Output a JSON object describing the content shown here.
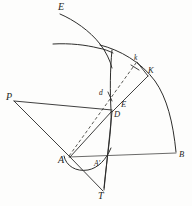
{
  "figure": {
    "background_color": "#fdfdfc",
    "ink_color": "#2a2a2a",
    "width": 192,
    "height": 206,
    "labels": {
      "E_top": "E",
      "k_lower": "k",
      "K_upper": "K",
      "d_lower": "d",
      "E_mid": "E",
      "D_mid": "D",
      "P_left": "P",
      "A_left": "A",
      "A_prime": "A'",
      "B_right": "B",
      "T_bottom": "T"
    },
    "points": [
      {
        "name": "E_top",
        "label": "E",
        "x": 62,
        "y": 8
      },
      {
        "name": "k_lower",
        "label": "k",
        "x": 137,
        "y": 60
      },
      {
        "name": "K_upper",
        "label": "K",
        "x": 150,
        "y": 72
      },
      {
        "name": "d_lower",
        "label": "d",
        "x": 104,
        "y": 95
      },
      {
        "name": "E_mid",
        "label": "E",
        "x": 123,
        "y": 106
      },
      {
        "name": "D_mid",
        "label": "D",
        "x": 116,
        "y": 114
      },
      {
        "name": "P_left",
        "label": "P",
        "x": 11,
        "y": 98
      },
      {
        "name": "A_left",
        "label": "A",
        "x": 68,
        "y": 158
      },
      {
        "name": "A_prime",
        "label": "A'",
        "x": 99,
        "y": 163
      },
      {
        "name": "B_right",
        "label": "B",
        "x": 178,
        "y": 155
      },
      {
        "name": "T_bottom",
        "label": "T",
        "x": 102,
        "y": 194
      }
    ],
    "strokes": [
      {
        "name": "upper-left-arc",
        "kind": "curve",
        "desc": "arc from E at top curving down-right past crossing"
      },
      {
        "name": "flat-left-arc",
        "kind": "curve",
        "desc": "shallow arc entering from left meeting the crossing"
      },
      {
        "name": "great-arc-to-B",
        "kind": "curve",
        "desc": "large arc from crossing sweeping right-down to B"
      },
      {
        "name": "vertical-curve-to-T",
        "kind": "curve",
        "desc": "near-vertical curve through D down to T"
      },
      {
        "name": "small-arc-at-A",
        "kind": "curve",
        "desc": "small concave-up arc starting at A"
      },
      {
        "name": "dashed-A-to-k",
        "kind": "dashed",
        "desc": "dashed ray from A through d up to k"
      },
      {
        "name": "segment-D-to-K",
        "kind": "solid",
        "desc": "segment from D up-right to K"
      },
      {
        "name": "segment-P-to-D",
        "kind": "solid",
        "desc": "near-horizontal segment from P to D"
      },
      {
        "name": "segment-P-to-A",
        "kind": "solid",
        "desc": "segment from P down-right to A"
      },
      {
        "name": "segment-A-to-D",
        "kind": "solid",
        "desc": "segment from A up-right to D"
      },
      {
        "name": "segment-A-to-T",
        "kind": "solid",
        "desc": "segment from A down-right to T"
      },
      {
        "name": "segment-A-to-B",
        "kind": "solid",
        "desc": "horizontal baseline from A to B"
      },
      {
        "name": "segment-D-to-T",
        "kind": "solid",
        "desc": "segment from D down to T"
      },
      {
        "name": "tick-at-k",
        "kind": "tick",
        "desc": "short tick crossing the dashed ray at k"
      },
      {
        "name": "tick-at-d",
        "kind": "tick",
        "desc": "short tick crossing the dashed ray at d"
      }
    ]
  }
}
